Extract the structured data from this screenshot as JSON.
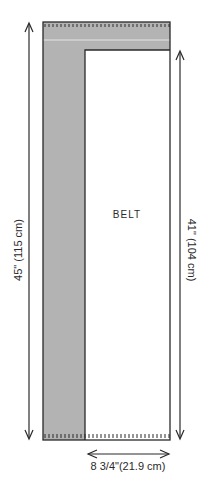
{
  "diagram": {
    "piece_label": "BELT",
    "height_overall": "45\" (115 cm)",
    "height_belt": "41\" (104 cm)",
    "width": "8 3/4\"(21.9 cm)",
    "colors": {
      "shade": "#b3b3b3",
      "outline": "#2a2a2a",
      "background": "#ffffff"
    }
  }
}
